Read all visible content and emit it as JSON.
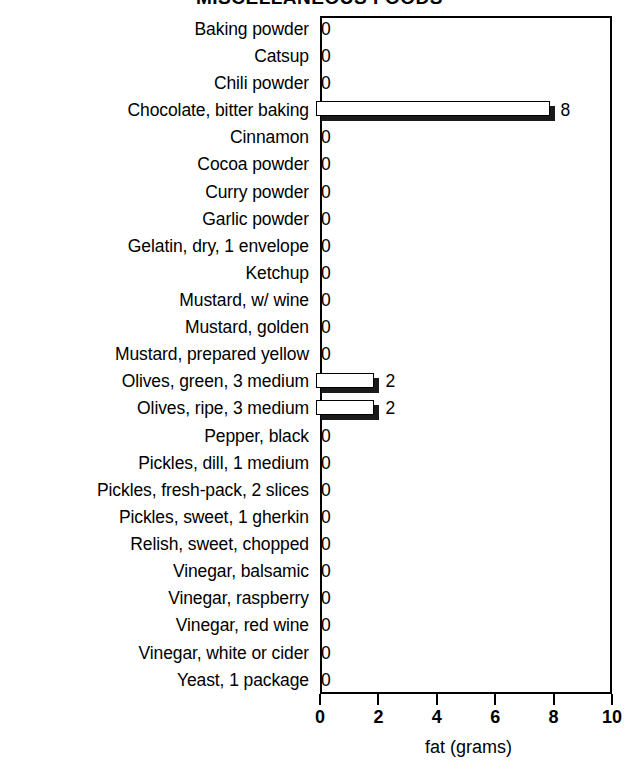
{
  "chart_data": {
    "type": "bar",
    "title": "MISCELLANEOUS FOODS",
    "xlabel": "fat (grams)",
    "ylabel": "",
    "xlim": [
      0,
      10
    ],
    "xticks": [
      0,
      2,
      4,
      6,
      8,
      10
    ],
    "grid": false,
    "legend": null,
    "orientation": "horizontal",
    "categories": [
      "Baking powder",
      "Catsup",
      "Chili powder",
      "Chocolate, bitter baking",
      "Cinnamon",
      "Cocoa powder",
      "Curry powder",
      "Garlic powder",
      "Gelatin, dry, 1 envelope",
      "Ketchup",
      "Mustard, w/ wine",
      "Mustard, golden",
      "Mustard, prepared yellow",
      "Olives, green, 3 medium",
      "Olives, ripe, 3 medium",
      "Pepper, black",
      "Pickles, dill, 1 medium",
      "Pickles, fresh-pack, 2 slices",
      "Pickles, sweet, 1 gherkin",
      "Relish, sweet, chopped",
      "Vinegar, balsamic",
      "Vinegar, raspberry",
      "Vinegar, red wine",
      "Vinegar, white or cider",
      "Yeast, 1 package"
    ],
    "values": [
      0,
      0,
      0,
      8,
      0,
      0,
      0,
      0,
      0,
      0,
      0,
      0,
      0,
      2,
      2,
      0,
      0,
      0,
      0,
      0,
      0,
      0,
      0,
      0,
      0
    ],
    "value_labels": [
      "0",
      "0",
      "0",
      "8",
      "0",
      "0",
      "0",
      "0",
      "0",
      "0",
      "0",
      "0",
      "0",
      "2",
      "2",
      "0",
      "0",
      "0",
      "0",
      "0",
      "0",
      "0",
      "0",
      "0",
      "0"
    ]
  },
  "colors": {
    "bar_fill": "#ffffff",
    "bar_outline": "#000000",
    "bar_shadow": "#1a1a1a",
    "axis": "#000000",
    "background": "#ffffff",
    "text": "#000000"
  }
}
